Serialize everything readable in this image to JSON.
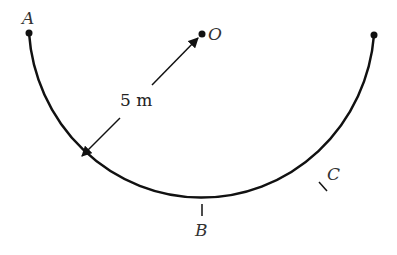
{
  "diagram": {
    "labels": {
      "A": "A",
      "O": "O",
      "B": "B",
      "C": "C",
      "radius": "5 m"
    },
    "colors": {
      "stroke": "#111111",
      "text": "#333333"
    }
  }
}
